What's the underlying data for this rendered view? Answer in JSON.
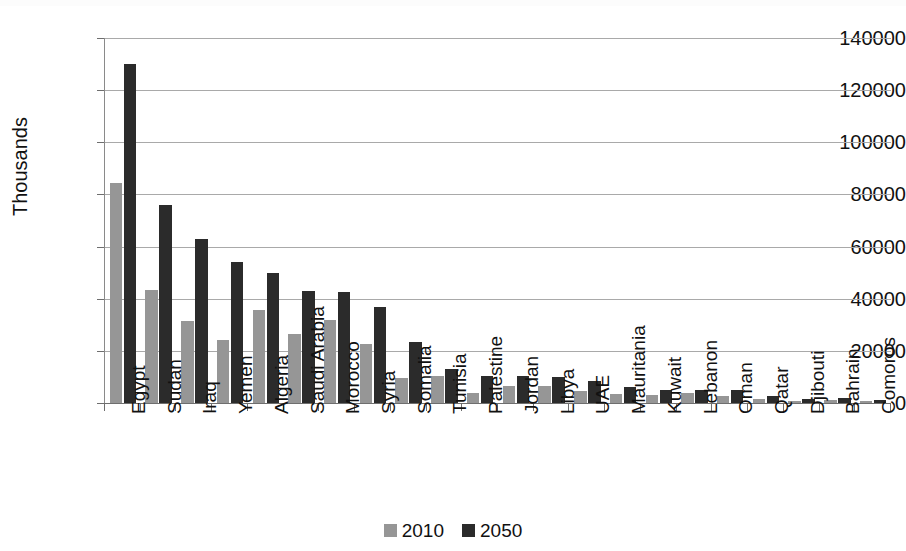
{
  "chart_data": {
    "type": "bar",
    "title": "",
    "xlabel": "",
    "ylabel": "Thousands",
    "ylim": [
      0,
      140000
    ],
    "ytick_values": [
      0,
      20000,
      40000,
      60000,
      80000,
      100000,
      120000,
      140000
    ],
    "ytick_labels": [
      "0",
      "20000",
      "40000",
      "60000",
      "80000",
      "100000",
      "120000",
      "140000"
    ],
    "grid": true,
    "legend_position": "bottom-center",
    "categories": [
      "Egypt",
      "Sudan",
      "Iraq",
      "Yemen",
      "Algeria",
      "Saudi Arabia",
      "Morocco",
      "Syria",
      "Somalia",
      "Tunisia",
      "Palestine",
      "Jordan",
      "Libya",
      "UAE",
      "Mauritania",
      "Kuwait",
      "Lebanon",
      "Oman",
      "Qatar",
      "Djibouti",
      "Bahrain",
      "Comoros"
    ],
    "series": [
      {
        "name": "2010",
        "color": "#969696",
        "values": [
          84500,
          43500,
          31500,
          24000,
          35500,
          26500,
          32000,
          22500,
          9500,
          10500,
          4000,
          6500,
          6500,
          4500,
          3500,
          3000,
          4000,
          2800,
          1700,
          900,
          1300,
          700
        ]
      },
      {
        "name": "2050",
        "color": "#2b2b2b",
        "values": [
          130000,
          76000,
          63000,
          54000,
          50000,
          43000,
          42500,
          37000,
          23500,
          13000,
          10500,
          10500,
          10000,
          8500,
          6000,
          5000,
          5000,
          5000,
          2500,
          1700,
          2000,
          1100
        ]
      }
    ]
  },
  "legend": {
    "entries": [
      {
        "label": "2010"
      },
      {
        "label": "2050"
      }
    ]
  },
  "axes": {
    "y_title": "Thousands"
  }
}
